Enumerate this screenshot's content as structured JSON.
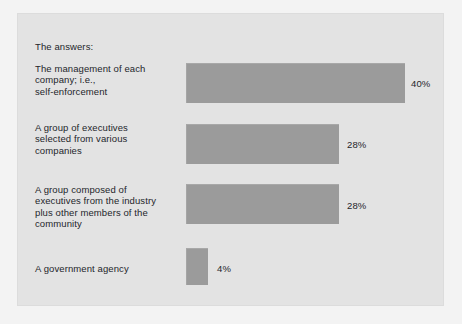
{
  "heading": "The answers:",
  "chart_data": {
    "type": "bar",
    "orientation": "horizontal",
    "title": "The answers:",
    "xlabel": "",
    "ylabel": "",
    "xlim": [
      0,
      40
    ],
    "grid": false,
    "legend": null,
    "value_suffix": "%",
    "categories": [
      "The management of each\ncompany; i.e.,\nself-enforcement",
      "A group of executives\nselected from various\ncompanies",
      "A group composed of\nexecutives from the industry\nplus other members of the\ncommunity",
      "A government agency"
    ],
    "values": [
      40,
      28,
      28,
      4
    ],
    "value_labels": [
      "40%",
      "28%",
      "28%",
      "4%"
    ],
    "colors": {
      "bar_fill": "#9b9b9b",
      "panel_background": "#e3e3e3",
      "figure_background": "#f3f3f3",
      "text": "#23262b"
    }
  }
}
